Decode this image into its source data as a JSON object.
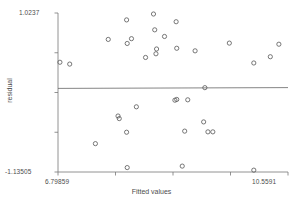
{
  "chart_data": {
    "type": "scatter",
    "title": "",
    "xlabel": "Fitted values",
    "ylabel": "residual",
    "xlim": [
      6.79859,
      10.5591
    ],
    "ylim": [
      -1.13505,
      1.0237
    ],
    "x_tick_labels": [
      "6.79859",
      "10.5591"
    ],
    "y_tick_labels": [
      "1.0237",
      "-1.13505"
    ],
    "grid": false,
    "legend": false,
    "marker": "open-circle",
    "marker_color": "#555555",
    "reference_line": {
      "type": "horizontal",
      "y": 0.0,
      "color": "#666666"
    },
    "points": [
      {
        "x": 6.83,
        "y": 0.355
      },
      {
        "x": 6.99,
        "y": 0.33
      },
      {
        "x": 7.62,
        "y": 0.665
      },
      {
        "x": 7.92,
        "y": 0.93
      },
      {
        "x": 7.93,
        "y": 0.61
      },
      {
        "x": 8.0,
        "y": 0.675
      },
      {
        "x": 8.23,
        "y": 0.42
      },
      {
        "x": 8.36,
        "y": 1.01
      },
      {
        "x": 8.38,
        "y": 0.795
      },
      {
        "x": 8.41,
        "y": 0.535
      },
      {
        "x": 8.4,
        "y": 0.47
      },
      {
        "x": 8.54,
        "y": 0.705
      },
      {
        "x": 8.73,
        "y": 0.905
      },
      {
        "x": 8.74,
        "y": 0.545
      },
      {
        "x": 9.04,
        "y": 0.51
      },
      {
        "x": 9.6,
        "y": 0.615
      },
      {
        "x": 10.41,
        "y": 0.6
      },
      {
        "x": 10.0,
        "y": 0.345
      },
      {
        "x": 10.27,
        "y": 0.43
      },
      {
        "x": 9.2,
        "y": 0.01
      },
      {
        "x": 8.71,
        "y": -0.16
      },
      {
        "x": 8.74,
        "y": -0.15
      },
      {
        "x": 8.92,
        "y": -0.155
      },
      {
        "x": 8.08,
        "y": -0.25
      },
      {
        "x": 7.78,
        "y": -0.375
      },
      {
        "x": 7.8,
        "y": -0.41
      },
      {
        "x": 7.92,
        "y": -0.595
      },
      {
        "x": 8.87,
        "y": -0.58
      },
      {
        "x": 9.18,
        "y": -0.455
      },
      {
        "x": 9.25,
        "y": -0.59
      },
      {
        "x": 9.33,
        "y": -0.59
      },
      {
        "x": 7.41,
        "y": -0.75
      },
      {
        "x": 7.93,
        "y": -1.075
      },
      {
        "x": 8.83,
        "y": -1.055
      },
      {
        "x": 10.0,
        "y": -1.11
      }
    ]
  }
}
